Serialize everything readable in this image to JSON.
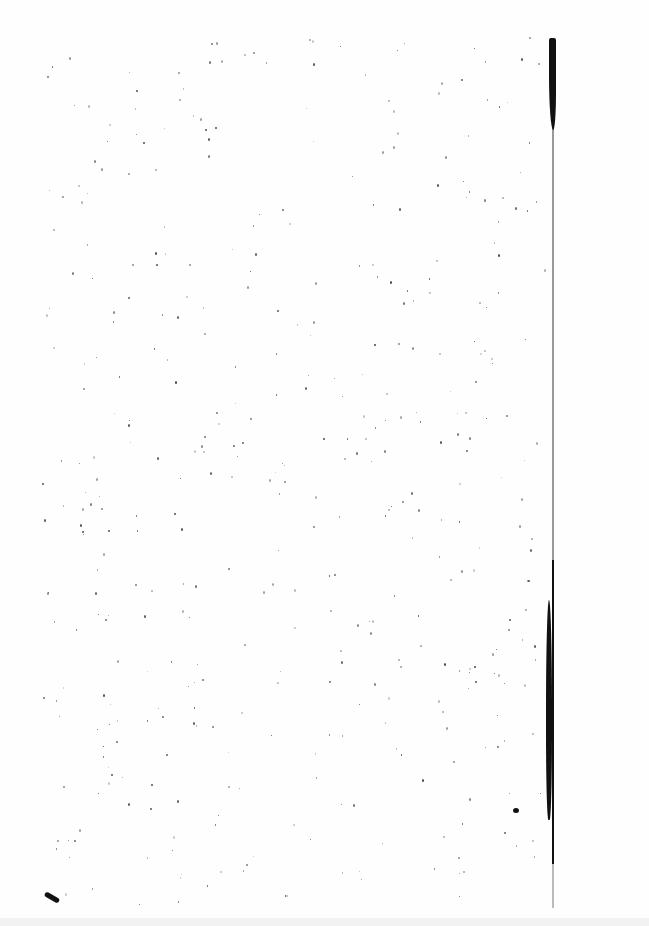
{
  "document": {
    "type": "scanned-page",
    "content": "",
    "features": [
      "speckle-noise",
      "binding-edge-right",
      "blank-page"
    ]
  },
  "colors": {
    "paper": "#fefefe",
    "ink": "#111111"
  }
}
